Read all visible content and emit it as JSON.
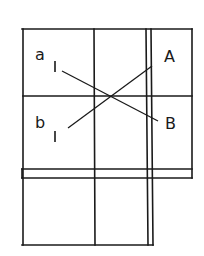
{
  "diagram": {
    "labels": {
      "a": "a",
      "b": "b",
      "A": "A",
      "B": "B",
      "sub_a": "I",
      "sub_b": "I"
    },
    "colors": {
      "stroke": "#1a1a1a",
      "background": "#ffffff"
    }
  }
}
